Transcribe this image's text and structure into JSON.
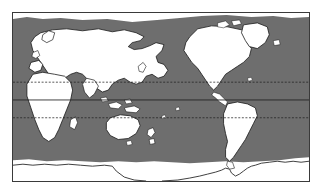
{
  "figure": {
    "type": "distribution-map",
    "projection": "equirectangular",
    "background_color": "#ffffff",
    "frame_color": "#3a3a3a",
    "land_color": "#ffffff",
    "land_outline_color": "#1a1a1a",
    "range_shading_color": "#6e6e6e",
    "ice_edge_color": "#2a2a2a",
    "graticule_color": "#1f1f1f"
  },
  "map": {
    "extent": {
      "lon_min": -180,
      "lon_max": 180,
      "lat_min": -90,
      "lat_max": 90
    },
    "frame": {
      "x": 12,
      "y": 12,
      "width": 298,
      "height": 170
    },
    "graticule": [
      {
        "name": "tropic-of-cancer",
        "latitude": 23.5,
        "style": "dashed",
        "y": 82
      },
      {
        "name": "equator",
        "latitude": 0,
        "style": "solid",
        "y": 100
      },
      {
        "name": "tropic-of-capricorn",
        "latitude": -23.5,
        "style": "dashed",
        "y": 118
      }
    ],
    "shaded_range": {
      "label": "shaded-ocean-distribution",
      "color": "#6e6e6e",
      "northern_limit_lat": 80,
      "southern_limit_lat": -62
    },
    "features": [
      {
        "name": "eurasia",
        "kind": "land"
      },
      {
        "name": "africa",
        "kind": "land"
      },
      {
        "name": "north-america",
        "kind": "land"
      },
      {
        "name": "south-america",
        "kind": "land"
      },
      {
        "name": "greenland",
        "kind": "land"
      },
      {
        "name": "australia",
        "kind": "land"
      },
      {
        "name": "new-zealand",
        "kind": "land"
      },
      {
        "name": "antarctica",
        "kind": "land"
      },
      {
        "name": "antarctic-ice-edge",
        "kind": "ice-boundary"
      },
      {
        "name": "indonesian-archipelago",
        "kind": "land"
      },
      {
        "name": "japan",
        "kind": "land"
      },
      {
        "name": "british-isles",
        "kind": "land"
      },
      {
        "name": "madagascar",
        "kind": "land"
      },
      {
        "name": "iceland",
        "kind": "land"
      },
      {
        "name": "arctic-archipelago",
        "kind": "land"
      }
    ]
  },
  "chart_data": {
    "type": "map",
    "title": "",
    "xlabel": "",
    "ylabel": "",
    "legend": [],
    "series": [
      {
        "name": "distribution-range",
        "representation": "gray-shaded-ocean",
        "color": "#6e6e6e",
        "description": "shaded marine area spanning roughly 80N to 62S across all ocean basins"
      },
      {
        "name": "landmasses",
        "representation": "white-fill-black-outline",
        "color": "#ffffff"
      }
    ],
    "xlim": [
      -180,
      180
    ],
    "ylim": [
      -90,
      90
    ],
    "grid": true
  }
}
